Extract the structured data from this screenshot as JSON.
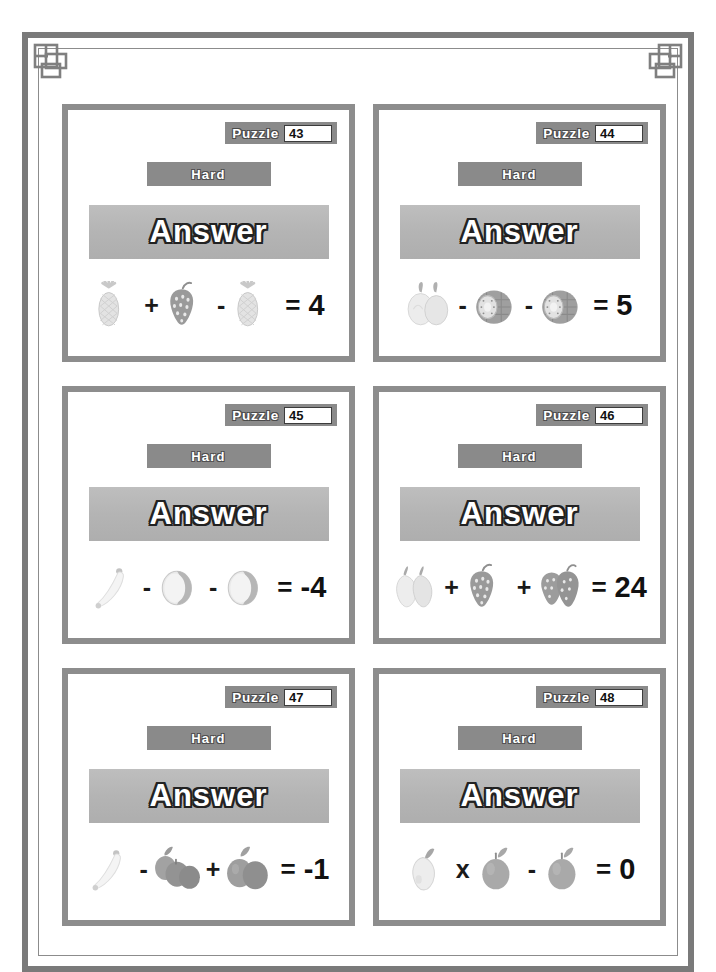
{
  "page": {
    "frame_color": "#7a7a7a",
    "background": "#ffffff",
    "card_border_color": "#8d8d8d",
    "tag_color": "#8a8a8a",
    "answer_box_color": "#b6b6b6"
  },
  "labels": {
    "puzzle_label": "Puzzle",
    "answer_label": "Answer",
    "difficulty": "Hard"
  },
  "puzzles": [
    {
      "number": "43",
      "difficulty": "Hard",
      "answer_label": "Answer",
      "equation": {
        "terms": [
          {
            "icon": "pineapple-icon",
            "count": 1
          },
          {
            "operator": "+"
          },
          {
            "icon": "strawberry-icon",
            "count": 1
          },
          {
            "operator": "-"
          },
          {
            "icon": "pineapple-icon",
            "count": 1
          }
        ],
        "equals": "=",
        "result": "4"
      }
    },
    {
      "number": "44",
      "difficulty": "Hard",
      "answer_label": "Answer",
      "equation": {
        "terms": [
          {
            "icon": "lychee-pair-icon",
            "count": 2
          },
          {
            "operator": "-"
          },
          {
            "icon": "kiwi-half-icon",
            "count": 1
          },
          {
            "operator": "-"
          },
          {
            "icon": "kiwi-half-icon",
            "count": 1
          }
        ],
        "equals": "=",
        "result": "5"
      }
    },
    {
      "number": "45",
      "difficulty": "Hard",
      "answer_label": "Answer",
      "equation": {
        "terms": [
          {
            "icon": "banana-icon",
            "count": 1
          },
          {
            "operator": "-"
          },
          {
            "icon": "coconut-half-icon",
            "count": 1
          },
          {
            "operator": "-"
          },
          {
            "icon": "coconut-half-icon",
            "count": 1
          }
        ],
        "equals": "=",
        "result": "-4"
      }
    },
    {
      "number": "46",
      "difficulty": "Hard",
      "answer_label": "Answer",
      "equation": {
        "terms": [
          {
            "icon": "pear-pair-icon",
            "count": 2
          },
          {
            "operator": "+"
          },
          {
            "icon": "strawberry-icon",
            "count": 1
          },
          {
            "operator": "+"
          },
          {
            "icon": "strawberry-pair-icon",
            "count": 2
          }
        ],
        "equals": "=",
        "result": "24"
      }
    },
    {
      "number": "47",
      "difficulty": "Hard",
      "answer_label": "Answer",
      "equation": {
        "terms": [
          {
            "icon": "banana-icon",
            "count": 1
          },
          {
            "operator": "-"
          },
          {
            "icon": "apple-triple-icon",
            "count": 3
          },
          {
            "operator": "+"
          },
          {
            "icon": "apple-pair-icon",
            "count": 2
          }
        ],
        "equals": "=",
        "result": "-1"
      }
    },
    {
      "number": "48",
      "difficulty": "Hard",
      "answer_label": "Answer",
      "equation": {
        "terms": [
          {
            "icon": "pear-icon",
            "count": 1
          },
          {
            "operator": "x"
          },
          {
            "icon": "apple-icon",
            "count": 1
          },
          {
            "operator": "-"
          },
          {
            "icon": "apple-icon",
            "count": 1
          }
        ],
        "equals": "=",
        "result": "0"
      }
    }
  ]
}
